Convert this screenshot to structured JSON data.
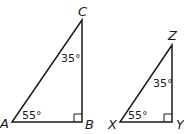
{
  "diagram": {
    "triangles": [
      {
        "name": "ABC",
        "vertices": {
          "A": "A",
          "B": "B",
          "C": "C"
        },
        "angles": {
          "A": "55°",
          "C": "35°",
          "B": "right"
        }
      },
      {
        "name": "XYZ",
        "vertices": {
          "X": "X",
          "Y": "Y",
          "Z": "Z"
        },
        "angles": {
          "X": "55°",
          "Z": "35°",
          "Y": "right"
        }
      }
    ]
  }
}
